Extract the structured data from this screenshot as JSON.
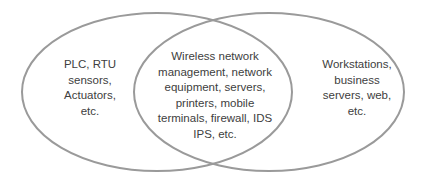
{
  "diagram": {
    "type": "venn",
    "stroke_color": "#9a9a9a",
    "text_color": "#404040",
    "sets": [
      {
        "id": "left",
        "lines": [
          "PLC, RTU",
          "sensors,",
          "Actuators,",
          "etc."
        ]
      },
      {
        "id": "right",
        "lines": [
          "Workstations,",
          "business",
          "servers, web,",
          "etc."
        ]
      }
    ],
    "intersection": {
      "lines": [
        "Wireless network",
        "management, network",
        "equipment, servers,",
        "printers, mobile",
        "terminals, firewall, IDS",
        "IPS, etc."
      ]
    }
  }
}
